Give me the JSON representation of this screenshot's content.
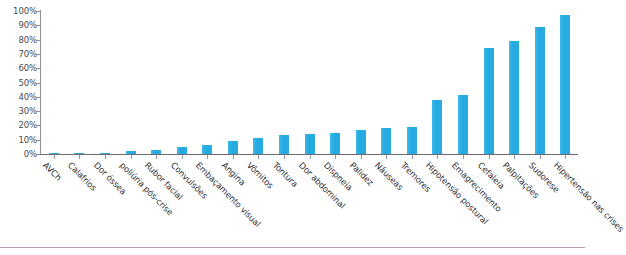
{
  "chart_data": {
    "type": "bar",
    "title": "",
    "xlabel": "",
    "ylabel": "",
    "ylim": [
      0,
      100
    ],
    "grid": false,
    "legend": false,
    "bar_color": "#29ABE2",
    "axis_color": "#8f8f93",
    "ytick_labels": [
      "100%",
      "90%",
      "80%",
      "70%",
      "60%",
      "50%",
      "40%",
      "30%",
      "20%",
      "10%",
      "0%"
    ],
    "ytick_values": [
      100,
      90,
      80,
      70,
      60,
      50,
      40,
      30,
      20,
      10,
      0
    ],
    "categories": [
      "AVCh",
      "Calafrios",
      "Dor óssea",
      "poliúria pós-crise",
      "Rubor facial",
      "Convulsões",
      "Embaçamento visual",
      "Angina",
      "Vômitos",
      "Tontura",
      "Dor abdominal",
      "Dispneia",
      "Palidez",
      "Náuseas",
      "Tremores",
      "Hipotensão postural",
      "Emagrecimento",
      "Cefaleia",
      "Palpitações",
      "Sudorese",
      "Hipertensão nas crises"
    ],
    "values": [
      1,
      1,
      1,
      2,
      3,
      5,
      6,
      9,
      11,
      13,
      14,
      15,
      17,
      18,
      19,
      38,
      41,
      74,
      79,
      89,
      97
    ]
  }
}
